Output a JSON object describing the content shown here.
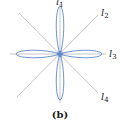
{
  "figure": {
    "caption": "(b)",
    "curve": "four-petal rose",
    "center": [
      60,
      54
    ],
    "petal_color": "#5b86c9",
    "line_color": "#b8b8b8",
    "lines": [
      {
        "id": "l1",
        "letter": "l",
        "sub": "1",
        "direction": "vertical"
      },
      {
        "id": "l2",
        "letter": "l",
        "sub": "2",
        "direction": "diagonal up-right"
      },
      {
        "id": "l3",
        "letter": "l",
        "sub": "3",
        "direction": "horizontal"
      },
      {
        "id": "l4",
        "letter": "l",
        "sub": "4",
        "direction": "diagonal down-right"
      }
    ]
  }
}
